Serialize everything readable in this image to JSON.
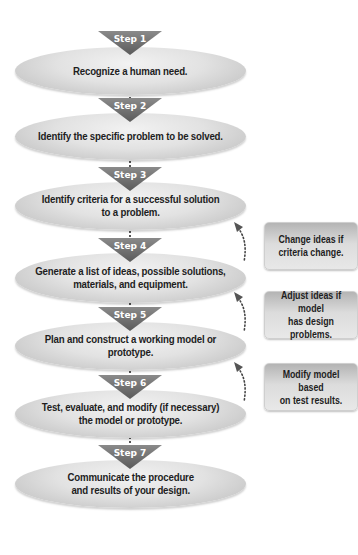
{
  "diagram": {
    "steps": [
      {
        "label": "Step 1",
        "text": "Recognize a human need."
      },
      {
        "label": "Step 2",
        "text": "Identify the specific problem to be solved."
      },
      {
        "label": "Step 3",
        "text": "Identify criteria for a successful solution\nto a problem."
      },
      {
        "label": "Step 4",
        "text": "Generate a list of ideas, possible solutions,\nmaterials, and equipment."
      },
      {
        "label": "Step 5",
        "text": "Plan and construct a working model or prototype."
      },
      {
        "label": "Step 6",
        "text": "Test, evaluate, and modify (if necessary)\nthe model or prototype."
      },
      {
        "label": "Step 7",
        "text": "Communicate the procedure\nand results of your design."
      }
    ],
    "feedback_notes": [
      {
        "text": "Change ideas if\ncriteria change.",
        "returns_to": "Step 3"
      },
      {
        "text": "Adjust ideas if model\nhas design problems.",
        "returns_to": "Step 4"
      },
      {
        "text": "Modify model based\non test results.",
        "returns_to": "Step 5"
      }
    ],
    "colors": {
      "ellipse_fill": "#e2e2e2",
      "step_arrow": "#6e6e6e",
      "note_fill": "#d0d0d0",
      "text": "#1e1e1e"
    }
  }
}
